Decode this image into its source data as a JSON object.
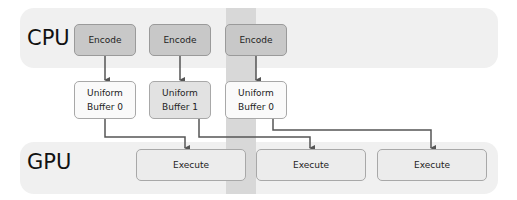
{
  "lanes": {
    "cpu": "CPU",
    "gpu": "GPU"
  },
  "cpu_tasks": [
    {
      "label": "Encode"
    },
    {
      "label": "Encode"
    },
    {
      "label": "Encode"
    }
  ],
  "uniform_buffers": [
    {
      "line1": "Uniform",
      "line2": "Buffer 0"
    },
    {
      "line1": "Uniform",
      "line2": "Buffer 1"
    },
    {
      "line1": "Uniform",
      "line2": "Buffer 0"
    }
  ],
  "gpu_tasks": [
    {
      "label": "Execute"
    },
    {
      "label": "Execute"
    },
    {
      "label": "Execute"
    }
  ],
  "colors": {
    "lane_bg": "#f0f0f0",
    "encode_fill": "#c8c8c8",
    "highlight_band": "#d8d8d8",
    "arrow": "#555555"
  }
}
